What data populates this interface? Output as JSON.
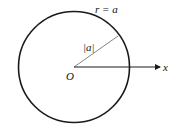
{
  "diagram": {
    "curve_label": "r = a",
    "radius_label": "|a|",
    "origin_label": "O",
    "axis_label": "x",
    "colors": {
      "stroke": "#1a1a1a",
      "radius_line": "#555555"
    }
  }
}
